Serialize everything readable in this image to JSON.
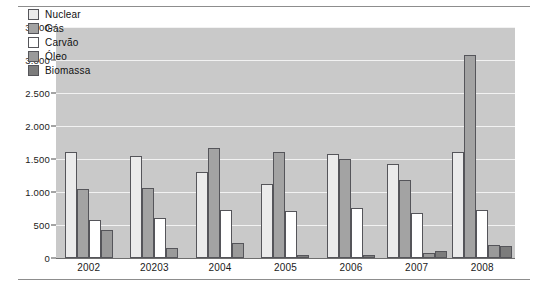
{
  "chart_data": {
    "type": "bar",
    "title": "",
    "subtitle": "",
    "xlabel": "",
    "ylabel": "",
    "categories": [
      "2002",
      "20203",
      "2004",
      "2005",
      "2006",
      "2007",
      "2008"
    ],
    "series": [
      {
        "name": "Nuclear",
        "color": "#ebebeb",
        "values": [
          1600,
          1550,
          1310,
          1120,
          1570,
          1420,
          1600
        ]
      },
      {
        "name": "Gás",
        "color": "#a3a3a3",
        "values": [
          1050,
          1060,
          1660,
          1610,
          1500,
          1180,
          3080
        ]
      },
      {
        "name": "Carvão",
        "color": "#ffffff",
        "values": [
          580,
          600,
          730,
          710,
          760,
          680,
          720
        ]
      },
      {
        "name": "Óleo",
        "color": "#9a9a9a",
        "values": [
          420,
          150,
          230,
          0,
          0,
          80,
          200
        ]
      },
      {
        "name": "Biomassa",
        "color": "#7c7c7c",
        "values": [
          0,
          0,
          0,
          50,
          40,
          110,
          180
        ]
      }
    ],
    "ylim": [
      0,
      3500
    ],
    "yticks": [
      0,
      500,
      1000,
      1500,
      2000,
      2500,
      3000,
      3500
    ],
    "ytick_labels": [
      "0",
      "500",
      "1.000",
      "1.500",
      "2.000",
      "2.500",
      "3.000",
      "3.500"
    ],
    "grid": true,
    "grid_color": "#f2f2f2",
    "plot_background": "#c9c9c9",
    "legend_position": "upper-left-inside",
    "legend_entries": [
      "Nuclear",
      "Gás",
      "Carvão",
      "Óleo",
      "Biomassa"
    ]
  }
}
